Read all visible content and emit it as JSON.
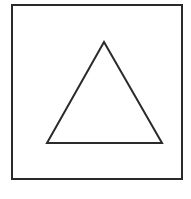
{
  "canvas": {
    "width": 191,
    "height": 199,
    "background": "#ffffff"
  },
  "shapes": {
    "square": {
      "x": 12,
      "y": 5,
      "width": 170,
      "height": 174,
      "stroke": "#2a2a2a",
      "stroke_width": 2
    },
    "triangle": {
      "points": "104,42 47,143 162,143",
      "stroke": "#2a2a2a",
      "stroke_width": 2
    }
  }
}
